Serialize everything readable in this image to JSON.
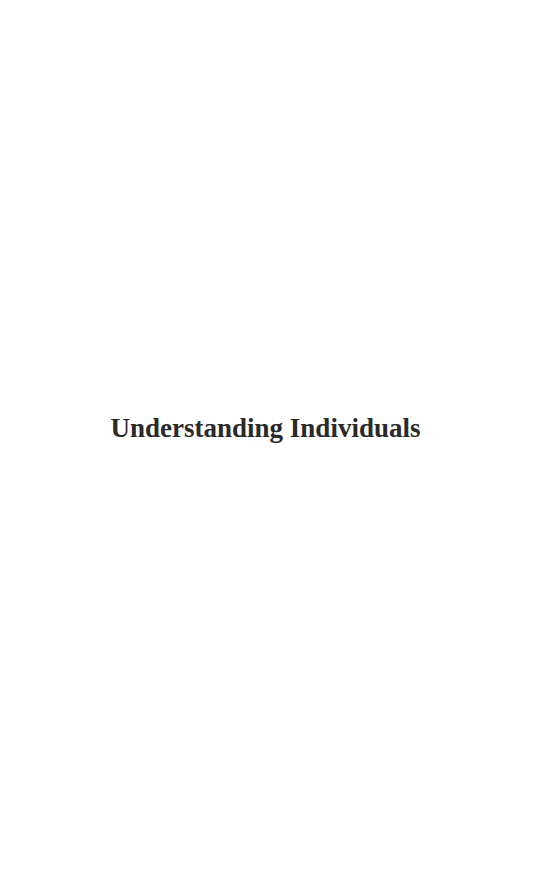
{
  "page": {
    "title": "Understanding Individuals",
    "background_color": "#ffffff",
    "text_color": "#2a2a2a"
  }
}
